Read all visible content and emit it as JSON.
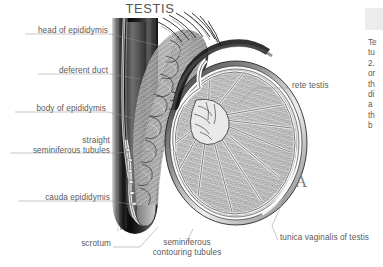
{
  "figure": {
    "title": "TESTIS",
    "panel_marker": "A",
    "type": "anatomical-illustration",
    "style": "grayscale pen-and-ink medical illustration",
    "background_color": "#ffffff",
    "label_color": "#5a5a5a",
    "leader_color": "#8d8d8d"
  },
  "labels": {
    "head_of_epididymis": "head of epididymis",
    "deferent_duct": "deferent duct",
    "body_of_epididymis": "body of epididymis",
    "straight_tubules_l1": "straight",
    "straight_tubules_l2": "seminiferous tubules",
    "cauda_epididymis": "cauda epididymis",
    "scrotum": "scrotum",
    "seminiferous_l1": "seminiferous",
    "seminiferous_l2": "contouring tubules",
    "rete_testis": "rete testis",
    "tunica_vaginalis": "tunica vaginalis of testis"
  },
  "side_text": {
    "lines": [
      "Te",
      "tu",
      "2.",
      "or",
      "th",
      "di",
      "a",
      "th",
      "b"
    ]
  }
}
